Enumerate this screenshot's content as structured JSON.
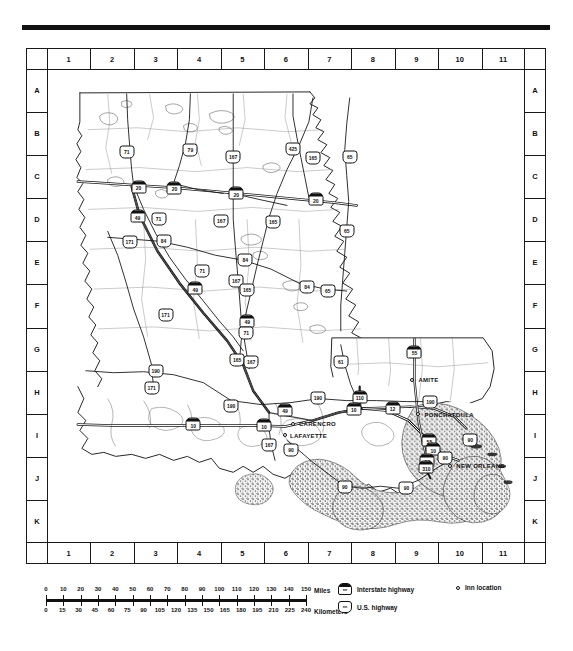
{
  "map": {
    "title": "Louisiana road map with inn locations",
    "grid": {
      "columns": [
        "1",
        "2",
        "3",
        "4",
        "5",
        "6",
        "7",
        "8",
        "9",
        "10",
        "11"
      ],
      "rows": [
        "A",
        "B",
        "C",
        "D",
        "E",
        "F",
        "G",
        "H",
        "I",
        "J",
        "K"
      ]
    },
    "cities": [
      {
        "name": "CARENCRO",
        "x": 246,
        "y": 355,
        "lx": 252,
        "ly": 355
      },
      {
        "name": "LAFAYETTE",
        "x": 238,
        "y": 367,
        "lx": 243,
        "ly": 368
      },
      {
        "name": "AMITE",
        "x": 366,
        "y": 311,
        "lx": 372,
        "ly": 311
      },
      {
        "name": "PONCHATOULA",
        "x": 372,
        "y": 345,
        "lx": 378,
        "ly": 346
      },
      {
        "name": "NEW ORLEANS",
        "x": 404,
        "y": 398,
        "lx": 410,
        "ly": 398
      }
    ],
    "shields": [
      {
        "type": "us",
        "number": "71",
        "x": 79,
        "y": 82
      },
      {
        "type": "us",
        "number": "79",
        "x": 143,
        "y": 80
      },
      {
        "type": "us",
        "number": "167",
        "x": 186,
        "y": 87
      },
      {
        "type": "us",
        "number": "425",
        "x": 246,
        "y": 79
      },
      {
        "type": "us",
        "number": "165",
        "x": 266,
        "y": 88
      },
      {
        "type": "us",
        "number": "65",
        "x": 303,
        "y": 87
      },
      {
        "type": "is",
        "number": "20",
        "x": 91,
        "y": 117
      },
      {
        "type": "is",
        "number": "20",
        "x": 127,
        "y": 118
      },
      {
        "type": "is",
        "number": "20",
        "x": 189,
        "y": 124
      },
      {
        "type": "is",
        "number": "20",
        "x": 269,
        "y": 130
      },
      {
        "type": "is",
        "number": "49",
        "x": 90,
        "y": 147
      },
      {
        "type": "us",
        "number": "71",
        "x": 111,
        "y": 150
      },
      {
        "type": "us",
        "number": "171",
        "x": 82,
        "y": 173
      },
      {
        "type": "us",
        "number": "84",
        "x": 116,
        "y": 172
      },
      {
        "type": "us",
        "number": "167",
        "x": 174,
        "y": 152
      },
      {
        "type": "us",
        "number": "165",
        "x": 226,
        "y": 153
      },
      {
        "type": "us",
        "number": "65",
        "x": 300,
        "y": 162
      },
      {
        "type": "us",
        "number": "84",
        "x": 198,
        "y": 191
      },
      {
        "type": "us",
        "number": "71",
        "x": 155,
        "y": 202
      },
      {
        "type": "us",
        "number": "167",
        "x": 189,
        "y": 212
      },
      {
        "type": "us",
        "number": "165",
        "x": 200,
        "y": 221
      },
      {
        "type": "us",
        "number": "84",
        "x": 260,
        "y": 218
      },
      {
        "type": "us",
        "number": "65",
        "x": 281,
        "y": 222
      },
      {
        "type": "is",
        "number": "49",
        "x": 148,
        "y": 219
      },
      {
        "type": "us",
        "number": "171",
        "x": 118,
        "y": 246
      },
      {
        "type": "is",
        "number": "49",
        "x": 200,
        "y": 252
      },
      {
        "type": "us",
        "number": "71",
        "x": 199,
        "y": 264
      },
      {
        "type": "us",
        "number": "61",
        "x": 294,
        "y": 293
      },
      {
        "type": "is",
        "number": "55",
        "x": 368,
        "y": 283
      },
      {
        "type": "us",
        "number": "165",
        "x": 190,
        "y": 291
      },
      {
        "type": "us",
        "number": "167",
        "x": 204,
        "y": 293
      },
      {
        "type": "us",
        "number": "190",
        "x": 108,
        "y": 302
      },
      {
        "type": "us",
        "number": "171",
        "x": 104,
        "y": 319
      },
      {
        "type": "us",
        "number": "190",
        "x": 184,
        "y": 337
      },
      {
        "type": "us",
        "number": "190",
        "x": 271,
        "y": 329
      },
      {
        "type": "is",
        "number": "110",
        "x": 313,
        "y": 328
      },
      {
        "type": "is",
        "number": "10",
        "x": 307,
        "y": 340
      },
      {
        "type": "us",
        "number": "190",
        "x": 384,
        "y": 333
      },
      {
        "type": "is",
        "number": "12",
        "x": 346,
        "y": 339
      },
      {
        "type": "is",
        "number": "10",
        "x": 146,
        "y": 356
      },
      {
        "type": "is",
        "number": "10",
        "x": 217,
        "y": 357
      },
      {
        "type": "is",
        "number": "49",
        "x": 238,
        "y": 341
      },
      {
        "type": "us",
        "number": "167",
        "x": 222,
        "y": 377
      },
      {
        "type": "us",
        "number": "90",
        "x": 244,
        "y": 382
      },
      {
        "type": "is",
        "number": "55",
        "x": 383,
        "y": 372
      },
      {
        "type": "is",
        "number": "10",
        "x": 387,
        "y": 381
      },
      {
        "type": "us",
        "number": "90",
        "x": 424,
        "y": 372
      },
      {
        "type": "is",
        "number": "10",
        "x": 381,
        "y": 392
      },
      {
        "type": "is",
        "number": "310",
        "x": 380,
        "y": 399
      },
      {
        "type": "us",
        "number": "90",
        "x": 399,
        "y": 390
      },
      {
        "type": "us",
        "number": "90",
        "x": 298,
        "y": 419
      },
      {
        "type": "us",
        "number": "90",
        "x": 360,
        "y": 420
      }
    ]
  },
  "scale": {
    "miles": {
      "unit": "Miles",
      "values": [
        "0",
        "10",
        "20",
        "30",
        "40",
        "50",
        "60",
        "70",
        "80",
        "90",
        "100",
        "110",
        "120",
        "130",
        "140",
        "150"
      ]
    },
    "kilometers": {
      "unit": "Kilometers",
      "values": [
        "0",
        "15",
        "30",
        "45",
        "60",
        "75",
        "90",
        "105",
        "120",
        "135",
        "150",
        "165",
        "180",
        "195",
        "210",
        "225",
        "240"
      ]
    }
  },
  "legend": {
    "items": [
      {
        "symbol": "interstate-shield",
        "glyph": "nn",
        "label": "Interstate highway"
      },
      {
        "symbol": "us-shield",
        "glyph": "nn",
        "label": "U.S. highway"
      },
      {
        "symbol": "inn-dot",
        "glyph": "",
        "label": "Inn location"
      }
    ]
  },
  "colors": {
    "ink": "#111111",
    "paper": "#ffffff"
  }
}
